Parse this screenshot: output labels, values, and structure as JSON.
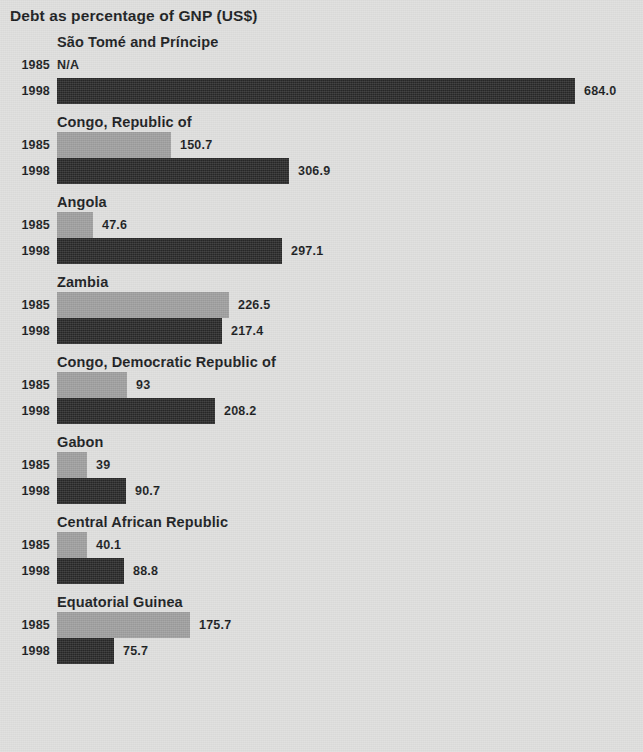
{
  "chart_data": {
    "type": "bar",
    "title": "Debt as percentage of GNP (US$)",
    "orientation": "horizontal",
    "xlabel": "",
    "ylabel": "",
    "grid": false,
    "legend_position": "none",
    "series": [
      {
        "name": "1985",
        "color": "#9c9c9c"
      },
      {
        "name": "1998",
        "color": "#272727"
      }
    ],
    "categories": [
      "São Tomé and Príncipe",
      "Congo, Republic of",
      "Angola",
      "Zambia",
      "Congo, Democratic Republic of",
      "Gabon",
      "Central African Republic",
      "Equatorial Guinea"
    ],
    "values_1985": [
      null,
      150.7,
      47.6,
      226.5,
      93,
      39,
      40.1,
      175.7
    ],
    "values_1998": [
      684.0,
      306.9,
      297.1,
      217.4,
      208.2,
      90.7,
      88.8,
      75.7
    ],
    "xlim": [
      0,
      684
    ]
  },
  "title": "Debt as percentage of GNP (US$)",
  "groups": [
    {
      "name": "São Tomé and Príncipe",
      "rows": [
        {
          "year": "1985",
          "value": null,
          "label": "N/A",
          "pct": 0
        },
        {
          "year": "1998",
          "value": 684.0,
          "label": "684.0",
          "pct": 100
        }
      ]
    },
    {
      "name": "Congo, Republic of",
      "rows": [
        {
          "year": "1985",
          "value": 150.7,
          "label": "150.7",
          "pct": 22.03
        },
        {
          "year": "1998",
          "value": 306.9,
          "label": "306.9",
          "pct": 44.87
        }
      ]
    },
    {
      "name": "Angola",
      "rows": [
        {
          "year": "1985",
          "value": 47.6,
          "label": "47.6",
          "pct": 6.96
        },
        {
          "year": "1998",
          "value": 297.1,
          "label": "297.1",
          "pct": 43.44
        }
      ]
    },
    {
      "name": "Zambia",
      "rows": [
        {
          "year": "1985",
          "value": 226.5,
          "label": "226.5",
          "pct": 33.11
        },
        {
          "year": "1998",
          "value": 217.4,
          "label": "217.4",
          "pct": 31.78
        }
      ]
    },
    {
      "name": "Congo, Democratic Republic of",
      "rows": [
        {
          "year": "1985",
          "value": 93,
          "label": "93",
          "pct": 13.6
        },
        {
          "year": "1998",
          "value": 208.2,
          "label": "208.2",
          "pct": 30.44
        }
      ]
    },
    {
      "name": "Gabon",
      "rows": [
        {
          "year": "1985",
          "value": 39,
          "label": "39",
          "pct": 5.7
        },
        {
          "year": "1998",
          "value": 90.7,
          "label": "90.7",
          "pct": 13.26
        }
      ]
    },
    {
      "name": "Central African Republic",
      "rows": [
        {
          "year": "1985",
          "value": 40.1,
          "label": "40.1",
          "pct": 5.86
        },
        {
          "year": "1998",
          "value": 88.8,
          "label": "88.8",
          "pct": 12.98
        }
      ]
    },
    {
      "name": "Equatorial Guinea",
      "rows": [
        {
          "year": "1985",
          "value": 175.7,
          "label": "175.7",
          "pct": 25.69
        },
        {
          "year": "1998",
          "value": 75.7,
          "label": "75.7",
          "pct": 11.07
        }
      ]
    }
  ],
  "colors": {
    "background": "#dddddc",
    "bar_1985": "#9c9c9c",
    "bar_1998": "#272727",
    "text": "#16181a"
  }
}
